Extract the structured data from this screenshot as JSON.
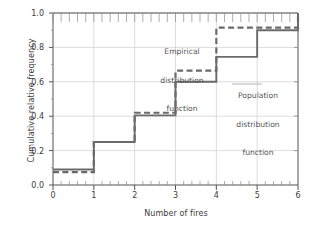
{
  "chart_data": {
    "type": "line",
    "title": "",
    "xlabel": "Number of fires",
    "ylabel": "Cumulative relative frequency",
    "xlim": [
      0,
      6
    ],
    "ylim": [
      0.0,
      1.0
    ],
    "xticks": [
      "0",
      "1",
      "2",
      "3",
      "4",
      "5",
      "6"
    ],
    "xtick_values": [
      0,
      1,
      2,
      3,
      4,
      5,
      6
    ],
    "yticks": [
      "0.0",
      "0.2",
      "0.4",
      "0.6",
      "0.8",
      "1.0"
    ],
    "ytick_values": [
      0.0,
      0.2,
      0.4,
      0.6,
      0.8,
      1.0
    ],
    "x_minor_ticks_per_interval": 5,
    "grid": true,
    "legend_position": "inline-annotations",
    "series": [
      {
        "name": "Empirical distribution function",
        "style": "solid",
        "color": "#6a6a6a",
        "step": "post",
        "x": [
          0,
          1,
          2,
          3,
          4,
          5,
          6
        ],
        "values": [
          0.09,
          0.25,
          0.405,
          0.6,
          0.745,
          0.9,
          1.0
        ]
      },
      {
        "name": "Population distribution function",
        "style": "dashed",
        "color": "#6a6a6a",
        "step": "post",
        "x": [
          0,
          1,
          2,
          3,
          4,
          5,
          6
        ],
        "values": [
          0.075,
          0.25,
          0.42,
          0.665,
          0.915,
          0.915,
          1.0
        ]
      }
    ],
    "annotations": [
      {
        "name": "empirical-annotation",
        "text": "Empirical\ndistribution\nfunction",
        "x": 2.95,
        "y": 0.88
      },
      {
        "name": "population-annotation",
        "text": "Population\ndistribution\nfunction",
        "x": 4.85,
        "y": 0.7
      }
    ]
  },
  "axes": {
    "ylabel": "Cumulative relative frequency",
    "xlabel": "Number of fires",
    "ytick_labels": [
      "1.0",
      "0.8",
      "0.6",
      "0.4",
      "0.2",
      "0.0"
    ],
    "xtick_labels": [
      "0",
      "1",
      "2",
      "3",
      "4",
      "5",
      "6"
    ]
  },
  "annotations": {
    "empirical": {
      "line1": "Empirical",
      "line2": "distribution",
      "line3": "function"
    },
    "population": {
      "line1": "Population",
      "line2": "distribution",
      "line3": "function"
    }
  },
  "colors": {
    "series": "#6a6a6a",
    "axis": "#555555",
    "grid": "#cfcfcf",
    "text": "#3b3b3b",
    "background": "#ffffff"
  }
}
